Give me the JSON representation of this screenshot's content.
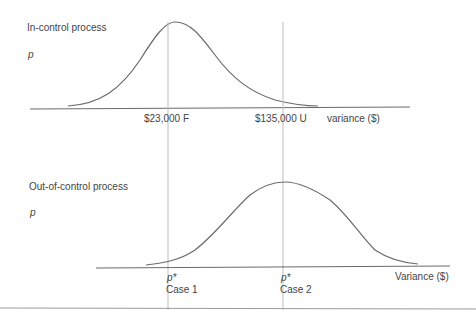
{
  "top_panel": {
    "title": "In-control process",
    "y_label": "p",
    "x_axis_label": "variance ($)",
    "markers": [
      {
        "label": "$23,000 F"
      },
      {
        "label": "$135,000 U"
      }
    ]
  },
  "bottom_panel": {
    "title": "Out-of-control process",
    "y_label": "p",
    "x_axis_label": "Variance ($)",
    "markers": [
      {
        "symbol": "p*",
        "label": "Case 1"
      },
      {
        "symbol": "p*",
        "label": "Case 2"
      }
    ]
  },
  "colors": {
    "line": "#6b6b6b",
    "guide": "#bdbdbd",
    "text": "#444444"
  }
}
